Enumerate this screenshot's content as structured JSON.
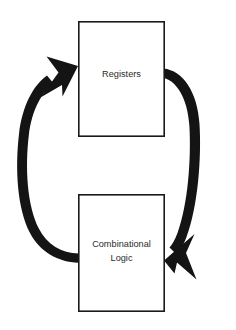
{
  "diagram": {
    "background_color": "#ffffff",
    "canvas": {
      "width": 236,
      "height": 330
    },
    "nodes": [
      {
        "id": "registers",
        "label": "Registers",
        "shape": "rectangle",
        "fill_color": "#ffffff",
        "border_color": "#1a1a1a",
        "x": 78,
        "y": 21,
        "width": 86,
        "height": 115
      },
      {
        "id": "combinational-logic",
        "label_line1": "Combinational",
        "label_line2": "Logic",
        "shape": "rectangle",
        "fill_color": "#ffffff",
        "border_color": "#1a1a1a",
        "x": 78,
        "y": 194,
        "width": 86,
        "height": 118
      }
    ],
    "edges": [
      {
        "id": "registers-to-combinational",
        "from": "registers",
        "to": "combinational-logic",
        "label": "",
        "color": "#141414",
        "style": "thick-curved-arrow",
        "direction": "clockwise-right-side"
      },
      {
        "id": "combinational-to-registers",
        "from": "combinational-logic",
        "to": "registers",
        "label": "",
        "color": "#141414",
        "style": "thick-curved-arrow",
        "direction": "clockwise-left-side"
      }
    ]
  }
}
